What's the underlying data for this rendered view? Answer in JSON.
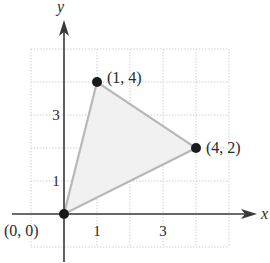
{
  "figure": {
    "type": "coordinate-plane-triangle",
    "axes": {
      "x_label": "x",
      "y_label": "y",
      "x_ticks": [
        {
          "value": 1,
          "label": "1"
        },
        {
          "value": 3,
          "label": "3"
        }
      ],
      "y_ticks": [
        {
          "value": 1,
          "label": "1"
        },
        {
          "value": 3,
          "label": "3"
        }
      ],
      "grid": {
        "x_min": -1,
        "x_max": 5,
        "y_min": -1,
        "y_max": 5,
        "step": 1,
        "style": "dotted"
      }
    },
    "vertices": [
      {
        "x": 0,
        "y": 0,
        "label": "(0, 0)"
      },
      {
        "x": 1,
        "y": 4,
        "label": "(1, 4)"
      },
      {
        "x": 4,
        "y": 2,
        "label": "(4, 2)"
      }
    ],
    "colors": {
      "axis": "#3a3a3a",
      "grid": "#d0d0d0",
      "triangle_fill": "#f1f1f1",
      "triangle_edge": "#b8b8b8",
      "point": "#1a1a1a",
      "text": "#2a2a2a"
    }
  },
  "chart_data": {
    "type": "scatter",
    "title": "",
    "xlabel": "x",
    "ylabel": "y",
    "xlim": [
      -1,
      5
    ],
    "ylim": [
      -1,
      5
    ],
    "grid": true,
    "series": [
      {
        "name": "triangle vertices",
        "points": [
          [
            0,
            0
          ],
          [
            1,
            4
          ],
          [
            4,
            2
          ]
        ],
        "closed_polygon": true,
        "filled": true
      }
    ],
    "annotations": [
      "(0, 0)",
      "(1, 4)",
      "(4, 2)"
    ],
    "x_tick_labels": [
      "1",
      "3"
    ],
    "y_tick_labels": [
      "1",
      "3"
    ]
  }
}
